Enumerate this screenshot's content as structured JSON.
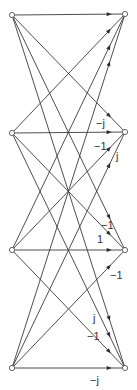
{
  "diagram": {
    "type": "signal-flow-graph",
    "colors": {
      "edge": "#3a3a3a",
      "node_fill": "#ffffff",
      "node_stroke": "#555555",
      "text": "#333333"
    },
    "left_nodes": [
      {
        "id": "x0",
        "x": 12,
        "y": 15
      },
      {
        "id": "x1",
        "x": 12,
        "y": 133
      },
      {
        "id": "x2",
        "x": 12,
        "y": 250
      },
      {
        "id": "x3",
        "x": 12,
        "y": 368
      }
    ],
    "right_nodes": [
      {
        "id": "X0",
        "x": 125,
        "y": 14
      },
      {
        "id": "X1",
        "x": 125,
        "y": 132
      },
      {
        "id": "X2",
        "x": 125,
        "y": 250
      },
      {
        "id": "X3",
        "x": 125,
        "y": 368
      }
    ],
    "edges": [
      {
        "from": 0,
        "to": 0
      },
      {
        "from": 0,
        "to": 1
      },
      {
        "from": 0,
        "to": 2
      },
      {
        "from": 0,
        "to": 3
      },
      {
        "from": 1,
        "to": 0
      },
      {
        "from": 1,
        "to": 1
      },
      {
        "from": 1,
        "to": 2
      },
      {
        "from": 1,
        "to": 3
      },
      {
        "from": 2,
        "to": 0
      },
      {
        "from": 2,
        "to": 1
      },
      {
        "from": 2,
        "to": 2
      },
      {
        "from": 2,
        "to": 3
      },
      {
        "from": 3,
        "to": 0
      },
      {
        "from": 3,
        "to": 1
      },
      {
        "from": 3,
        "to": 2
      },
      {
        "from": 3,
        "to": 3
      }
    ],
    "labels": [
      {
        "text": "−j",
        "x": 96,
        "y": 127
      },
      {
        "text": "−1",
        "x": 94,
        "y": 150
      },
      {
        "text": "j",
        "x": 116,
        "y": 160
      },
      {
        "text": "−1",
        "x": 101,
        "y": 229
      },
      {
        "text": "1",
        "x": 97,
        "y": 243
      },
      {
        "text": "−1",
        "x": 110,
        "y": 279
      },
      {
        "text": "j",
        "x": 93,
        "y": 322
      },
      {
        "text": "−1",
        "x": 87,
        "y": 340
      },
      {
        "text": "−j",
        "x": 90,
        "y": 384
      }
    ]
  }
}
